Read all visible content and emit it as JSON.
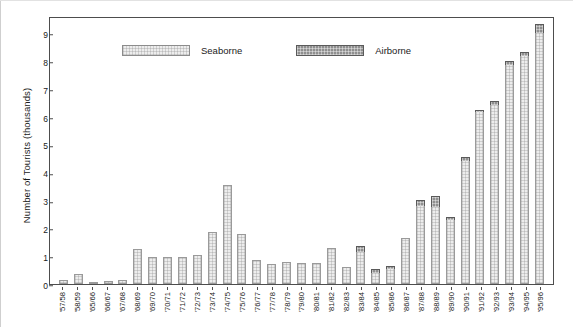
{
  "chart_data": {
    "type": "bar",
    "subtype": "stacked",
    "title": "",
    "xlabel": "",
    "ylabel": "Number of Tourists (thousands)",
    "ylim": [
      0,
      9.6
    ],
    "yticks": [
      0,
      1,
      2,
      3,
      4,
      5,
      6,
      7,
      8,
      9
    ],
    "ytick_labels": [
      "0",
      "1",
      "2",
      "3",
      "4",
      "5",
      "6",
      "7",
      "8",
      "9"
    ],
    "grid": false,
    "legend_position": "top-left-inside",
    "categories": [
      "'57/58",
      "'58/59",
      "'65/66",
      "'66/67",
      "'67/68",
      "'68/69",
      "'69/70",
      "'70/71",
      "'71/72",
      "'72/73",
      "'73/74",
      "'74/75",
      "'75/76",
      "'76/77",
      "'77/78",
      "'78/79",
      "'79/80",
      "'80/81",
      "'81/82",
      "'82/83",
      "'83/84",
      "'84/85",
      "'85/86",
      "'86/87",
      "'87/88",
      "'88/89",
      "'89/90",
      "'90/91",
      "'91/92",
      "'92/93",
      "'93/94",
      "'94/95",
      "'95/96"
    ],
    "series": [
      {
        "name": "Seaborne",
        "color": "#ededed",
        "values": [
          0.15,
          0.35,
          0.05,
          0.1,
          0.15,
          1.25,
          0.95,
          0.95,
          0.95,
          1.05,
          1.85,
          3.55,
          1.8,
          0.85,
          0.7,
          0.8,
          0.75,
          0.75,
          1.3,
          0.6,
          1.15,
          0.4,
          0.55,
          1.65,
          2.8,
          2.75,
          2.3,
          4.4,
          6.15,
          6.4,
          7.85,
          8.15,
          9.0
        ]
      },
      {
        "name": "Airborne",
        "color": "#8f8f8f",
        "values": [
          0,
          0,
          0,
          0,
          0,
          0,
          0,
          0,
          0,
          0,
          0,
          0,
          0,
          0,
          0,
          0,
          0,
          0,
          0,
          0,
          0.2,
          0.15,
          0.1,
          0,
          0.2,
          0.4,
          0.1,
          0.15,
          0.1,
          0.15,
          0.15,
          0.15,
          0.3
        ]
      }
    ],
    "totals": [
      0.15,
      0.35,
      0.05,
      0.1,
      0.15,
      1.25,
      0.95,
      0.95,
      0.95,
      1.05,
      1.85,
      3.55,
      1.8,
      0.85,
      0.7,
      0.8,
      0.75,
      0.75,
      1.3,
      0.6,
      1.35,
      0.55,
      0.65,
      1.65,
      3.0,
      3.15,
      2.4,
      4.55,
      6.25,
      6.55,
      8.0,
      8.3,
      9.3
    ]
  },
  "legend": {
    "items": [
      {
        "label": "Seaborne",
        "swatch": "seaborne-swatch"
      },
      {
        "label": "Airborne",
        "swatch": "airborne-swatch"
      }
    ]
  }
}
